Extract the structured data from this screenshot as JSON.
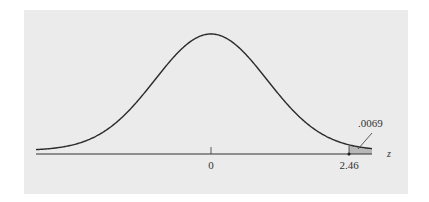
{
  "chart_data": {
    "type": "area",
    "title": "",
    "xlabel": "z",
    "ylabel": "",
    "x_ticks": [
      "0",
      "2.46"
    ],
    "shaded_region": {
      "from": 2.46,
      "to": "inf",
      "area": ".0069"
    },
    "annotations": [
      ".0069"
    ],
    "distribution": "standard normal"
  },
  "labels": {
    "zero": "0",
    "critical": "2.46",
    "area": ".0069",
    "axis": "z"
  },
  "colors": {
    "panel": "#ebebeb",
    "curve": "#2b2b2b",
    "shade": "#b8b8b8"
  }
}
